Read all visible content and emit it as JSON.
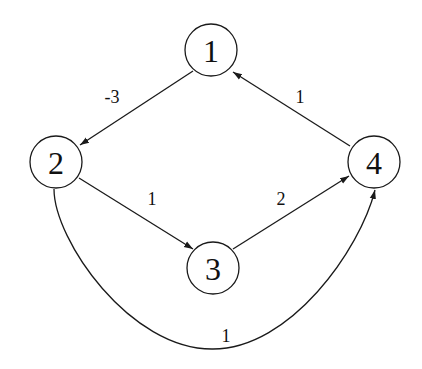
{
  "graph": {
    "type": "directed-weighted-graph",
    "nodes": [
      {
        "id": "1",
        "label": "1",
        "x": 211,
        "y": 50
      },
      {
        "id": "2",
        "label": "2",
        "x": 56,
        "y": 162
      },
      {
        "id": "3",
        "label": "3",
        "x": 213,
        "y": 268
      },
      {
        "id": "4",
        "label": "4",
        "x": 374,
        "y": 162
      }
    ],
    "edges": [
      {
        "from": "1",
        "to": "2",
        "weight": "-3"
      },
      {
        "from": "2",
        "to": "3",
        "weight": "1"
      },
      {
        "from": "3",
        "to": "4",
        "weight": "2"
      },
      {
        "from": "4",
        "to": "1",
        "weight": "1"
      },
      {
        "from": "2",
        "to": "4",
        "weight": "1",
        "curved": true
      }
    ]
  },
  "colors": {
    "stroke": "#1a1a1a",
    "background": "#ffffff"
  }
}
